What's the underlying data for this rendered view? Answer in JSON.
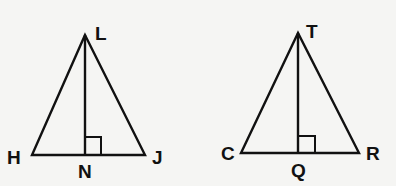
{
  "figures": [
    {
      "name": "triangle-HLJ",
      "vertices": {
        "apex": "L",
        "left": "H",
        "right": "J",
        "foot": "N"
      },
      "right_angle_at": "N"
    },
    {
      "name": "triangle-CTR",
      "vertices": {
        "apex": "T",
        "left": "C",
        "right": "R",
        "foot": "Q"
      },
      "right_angle_at": "Q"
    }
  ],
  "labels": {
    "L": "L",
    "H": "H",
    "J": "J",
    "N": "N",
    "T": "T",
    "C": "C",
    "R": "R",
    "Q": "Q"
  },
  "colors": {
    "stroke": "#111111",
    "background": "#f5f5f3"
  }
}
